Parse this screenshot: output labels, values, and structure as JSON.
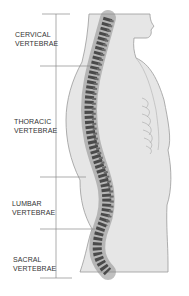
{
  "diagram": {
    "regions": [
      {
        "id": "cervical",
        "line1": "CERVICAL",
        "line2": "VERTEBRAE",
        "top": 14,
        "bottom": 66
      },
      {
        "id": "thoracic",
        "line1": "THORACIC",
        "line2": "VERTEBRAE",
        "top": 66,
        "bottom": 177
      },
      {
        "id": "lumbar",
        "line1": "LUMBAR",
        "line2": "VERTEBRAE",
        "top": 177,
        "bottom": 229
      },
      {
        "id": "sacral",
        "line1": "SACRAL",
        "line2": "VERTEBRAE",
        "top": 229,
        "bottom": 278
      }
    ],
    "colors": {
      "background": "#ffffff",
      "body_fill": "#e6e6e6",
      "body_stroke": "#9a9a9a",
      "spine_dark": "#4a4a4a",
      "spine_mid": "#8c8c8c",
      "bracket_line": "#8a8a8a",
      "text": "#333333"
    }
  }
}
